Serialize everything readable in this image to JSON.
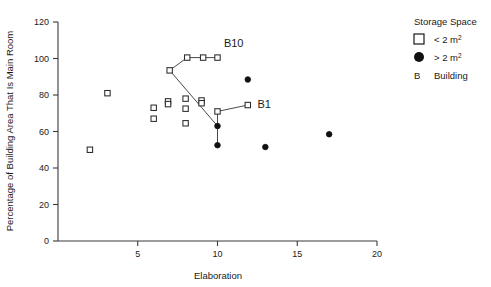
{
  "chart_data": {
    "type": "scatter",
    "title": "",
    "xlabel": "Elaboration",
    "ylabel": "Percentage of Building Area That Is Main Room",
    "xlim": [
      0,
      20
    ],
    "ylim": [
      0,
      120
    ],
    "xticks": [
      5,
      10,
      15,
      20
    ],
    "yticks": [
      0,
      20,
      40,
      60,
      80,
      100,
      120
    ],
    "grid": false,
    "legend": {
      "title": "Storage Space",
      "position": "right",
      "entries": [
        {
          "marker": "open-square",
          "label": "< 2 m",
          "sup": "2"
        },
        {
          "marker": "filled-circle",
          "label": "> 2 m",
          "sup": "2"
        },
        {
          "marker": "letter-b",
          "label": "Building",
          "sup": ""
        }
      ]
    },
    "series": [
      {
        "name": "< 2 m2",
        "marker": "open-square",
        "points": [
          {
            "x": 2.0,
            "y": 50.0
          },
          {
            "x": 3.1,
            "y": 81.0
          },
          {
            "x": 6.0,
            "y": 73.0
          },
          {
            "x": 6.0,
            "y": 67.0
          },
          {
            "x": 6.9,
            "y": 76.5
          },
          {
            "x": 6.9,
            "y": 75.0
          },
          {
            "x": 7.0,
            "y": 93.5
          },
          {
            "x": 8.0,
            "y": 78.0
          },
          {
            "x": 8.0,
            "y": 72.5
          },
          {
            "x": 8.0,
            "y": 64.5
          },
          {
            "x": 8.1,
            "y": 100.5
          },
          {
            "x": 9.0,
            "y": 77.0
          },
          {
            "x": 9.0,
            "y": 75.5
          },
          {
            "x": 9.1,
            "y": 100.5
          },
          {
            "x": 10.0,
            "y": 100.5
          },
          {
            "x": 10.0,
            "y": 71.0
          },
          {
            "x": 11.9,
            "y": 74.5
          }
        ]
      },
      {
        "name": "> 2 m2",
        "marker": "filled-circle",
        "points": [
          {
            "x": 10.0,
            "y": 63.0
          },
          {
            "x": 10.0,
            "y": 52.5
          },
          {
            "x": 11.9,
            "y": 88.5
          },
          {
            "x": 13.0,
            "y": 51.5
          },
          {
            "x": 17.0,
            "y": 58.5
          }
        ]
      }
    ],
    "connectors": [
      {
        "name": "B10-path",
        "path": [
          {
            "x": 7.0,
            "y": 93.5
          },
          {
            "x": 8.1,
            "y": 100.5
          },
          {
            "x": 9.1,
            "y": 100.5
          },
          {
            "x": 10.0,
            "y": 100.5
          }
        ]
      },
      {
        "name": "B10-descending-path",
        "path": [
          {
            "x": 7.0,
            "y": 93.5
          },
          {
            "x": 10.0,
            "y": 63.0
          },
          {
            "x": 10.0,
            "y": 52.5
          }
        ]
      },
      {
        "name": "B1-path",
        "path": [
          {
            "x": 10.0,
            "y": 63.0
          },
          {
            "x": 10.0,
            "y": 71.0
          },
          {
            "x": 11.9,
            "y": 74.5
          }
        ]
      }
    ],
    "annotations": [
      {
        "text": "B10",
        "x": 10.4,
        "y": 106.5
      },
      {
        "text": "B1",
        "x": 12.5,
        "y": 73.0
      }
    ]
  }
}
